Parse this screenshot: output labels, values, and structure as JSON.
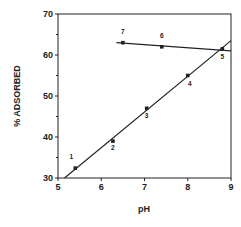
{
  "chart_data": {
    "type": "scatter",
    "title": "",
    "xlabel": "pH",
    "ylabel": "% ADSORBED",
    "xlim": [
      5,
      9
    ],
    "ylim": [
      30,
      70
    ],
    "xticks": [
      5,
      6,
      7,
      8,
      9
    ],
    "yticks": [
      30,
      40,
      50,
      60,
      70
    ],
    "grid": false,
    "legend": null,
    "points": [
      {
        "label": "1",
        "x": 5.4,
        "y": 32.4
      },
      {
        "label": "2",
        "x": 6.27,
        "y": 39.0
      },
      {
        "label": "3",
        "x": 7.05,
        "y": 47.0
      },
      {
        "label": "4",
        "x": 8.0,
        "y": 55.0
      },
      {
        "label": "5",
        "x": 8.8,
        "y": 61.5
      },
      {
        "label": "6",
        "x": 7.4,
        "y": 62.0
      },
      {
        "label": "7",
        "x": 6.5,
        "y": 63.0
      }
    ],
    "fit_lines": [
      {
        "name": "rising fit (points 1-5)",
        "x": [
          5.15,
          9.0
        ],
        "y": [
          30.0,
          63.5
        ]
      },
      {
        "name": "flat fit (points 5-7)",
        "x": [
          6.35,
          9.0
        ],
        "y": [
          63.0,
          61.0
        ]
      }
    ]
  },
  "axis": {
    "x_label": "pH",
    "y_label": "% ADSORBED",
    "x_ticks": [
      "5",
      "6",
      "7",
      "8",
      "9"
    ],
    "y_ticks": [
      "30",
      "40",
      "50",
      "60",
      "70"
    ]
  }
}
